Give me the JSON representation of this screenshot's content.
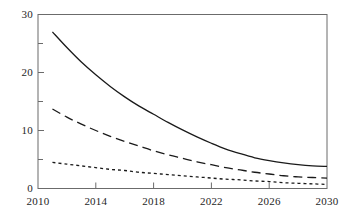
{
  "chart_data": {
    "type": "line",
    "title": "",
    "subtitle": "",
    "xlabel": "",
    "ylabel": "",
    "xlim": [
      2010,
      2030
    ],
    "ylim": [
      0,
      30
    ],
    "grid": false,
    "legend": "none",
    "x_ticks": [
      2010,
      2014,
      2018,
      2022,
      2026,
      2030
    ],
    "x_tick_labels": [
      "2010",
      "2014",
      "2018",
      "2022",
      "2026",
      "2030"
    ],
    "y_ticks": [
      0,
      10,
      20,
      30
    ],
    "y_tick_labels": [
      "0",
      "10",
      "20",
      "30"
    ],
    "y_minor_ticks": [
      5,
      15,
      25
    ],
    "x": [
      2011,
      2012,
      2013,
      2014,
      2015,
      2016,
      2017,
      2018,
      2019,
      2020,
      2021,
      2022,
      2023,
      2024,
      2025,
      2026,
      2027,
      2028,
      2029,
      2030
    ],
    "series": [
      {
        "name": "solid-curve",
        "style": "solid",
        "color": "#1a1a1a",
        "values": [
          27.0,
          24.3,
          21.8,
          19.6,
          17.6,
          15.8,
          14.2,
          12.8,
          11.4,
          10.1,
          8.9,
          7.8,
          6.8,
          6.0,
          5.3,
          4.8,
          4.4,
          4.1,
          3.9,
          3.8
        ]
      },
      {
        "name": "long-dashed-curve",
        "style": "dashed",
        "color": "#1a1a1a",
        "values": [
          13.7,
          12.3,
          11.1,
          10.0,
          9.0,
          8.1,
          7.3,
          6.5,
          5.8,
          5.2,
          4.6,
          4.1,
          3.6,
          3.2,
          2.8,
          2.5,
          2.2,
          2.0,
          1.9,
          1.8
        ]
      },
      {
        "name": "dotted-curve",
        "style": "dotted",
        "color": "#1a1a1a",
        "values": [
          4.5,
          4.2,
          3.9,
          3.6,
          3.3,
          3.1,
          2.8,
          2.6,
          2.4,
          2.2,
          2.0,
          1.8,
          1.6,
          1.5,
          1.3,
          1.2,
          1.0,
          0.9,
          0.8,
          0.7
        ]
      }
    ]
  },
  "axes": {
    "frame_color": "#6b6b6b",
    "tick_color": "#6b6b6b"
  }
}
